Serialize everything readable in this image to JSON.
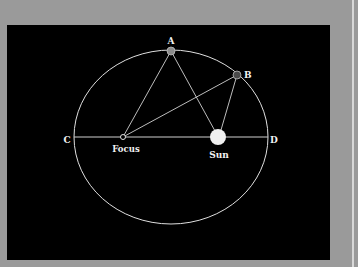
{
  "diagram": {
    "colors": {
      "background": "#9a9a9a",
      "panel": "#000000",
      "orbit": "#e0e0e0",
      "lines": "#bdbdbd",
      "point_a": "#8c8c8c",
      "point_b": "#4a4a4a",
      "sun": "#f0f0f0",
      "label": "#f2f2f2"
    },
    "ellipse": {
      "cx": 171,
      "cy": 137,
      "rx": 97,
      "ry": 87
    },
    "points": {
      "A": {
        "label": "A",
        "x": 171,
        "y": 51
      },
      "B": {
        "label": "B",
        "x": 237,
        "y": 75
      },
      "C": {
        "label": "C",
        "x": 74,
        "y": 137
      },
      "D": {
        "label": "D",
        "x": 268,
        "y": 137
      },
      "focus": {
        "label": "Focus",
        "x": 123,
        "y": 137
      },
      "sun": {
        "label": "Sun",
        "x": 218,
        "y": 137
      }
    },
    "labels": {
      "a": "A",
      "b": "B",
      "c": "C",
      "d": "D",
      "focus": "Focus",
      "sun": "Sun"
    }
  }
}
